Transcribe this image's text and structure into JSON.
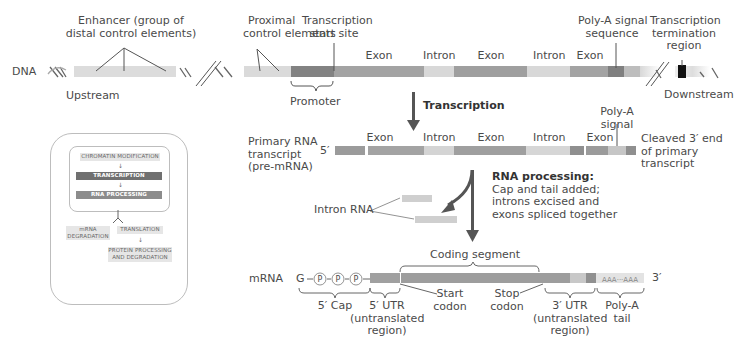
{
  "dna": {
    "label": "DNA",
    "enhancer_label": "Enhancer (group of\ndistal control elements)",
    "enhancer_line1": "Enhancer (group of",
    "enhancer_line2": "distal control elements)",
    "upstream": "Upstream",
    "proximal_line1": "Proximal",
    "proximal_line2": "control elements",
    "tss_line1": "Transcription",
    "tss_line2": "start site",
    "promoter": "Promoter",
    "segments": [
      "Exon",
      "Intron",
      "Exon",
      "Intron",
      "Exon"
    ],
    "polya_line1": "Poly-A signal",
    "polya_line2": "sequence",
    "term_line1": "Transcription",
    "term_line2": "termination",
    "term_line3": "region",
    "downstream": "Downstream"
  },
  "transcription": {
    "label": "Transcription"
  },
  "pre_mrna": {
    "label_line1": "Primary RNA",
    "label_line2": "transcript",
    "label_line3": "(pre-mRNA)",
    "five_prime": "5′",
    "segments": [
      "Exon",
      "Intron",
      "Exon",
      "Intron",
      "Exon"
    ],
    "polya_line1": "Poly-A",
    "polya_line2": "signal",
    "cleaved_line1": "Cleaved 3′ end",
    "cleaved_line2": "of primary",
    "cleaved_line3": "transcript"
  },
  "processing": {
    "title": "RNA processing:",
    "line1": "Cap and tail added;",
    "line2": "introns excised and",
    "line3": "exons spliced together",
    "intron_rna": "Intron RNA"
  },
  "mrna": {
    "label": "mRNA",
    "cap_g": "G",
    "phosphate": "P",
    "coding_segment": "Coding segment",
    "five_cap": "5′ Cap",
    "utr5_line1": "5′ UTR",
    "utr5_line2": "(untranslated",
    "utr5_line3": "region)",
    "start_line1": "Start",
    "start_line2": "codon",
    "stop_line1": "Stop",
    "stop_line2": "codon",
    "utr3_line1": "3′ UTR",
    "utr3_line2": "(untranslated",
    "utr3_line3": "region)",
    "polya_line1": "Poly-A",
    "polya_line2": "tail",
    "tail_text": "AAA···AAA",
    "three_prime": "3′"
  },
  "overview": {
    "chromatin": "CHROMATIN MODIFICATION",
    "transcription": "TRANSCRIPTION",
    "rna_processing": "RNA PROCESSING",
    "mrna_deg_line1": "mRNA",
    "mrna_deg_line2": "DEGRADATION",
    "translation": "TRANSLATION",
    "protein_line1": "PROTEIN PROCESSING",
    "protein_line2": "AND DEGRADATION"
  },
  "colors": {
    "exon": "#9b9b9b",
    "intron": "#d4d4d4",
    "promoter": "#808080",
    "enhancer": "#dcdcdc",
    "dark": "#555555",
    "termination": "#111111"
  }
}
